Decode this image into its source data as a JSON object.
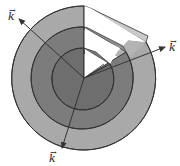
{
  "diagram": {
    "shells": [
      {
        "name": "outer",
        "radius": 72,
        "color": "#a9a9a9"
      },
      {
        "name": "middle",
        "radius": 51,
        "color": "#7c7c7c"
      },
      {
        "name": "inner",
        "radius": 31,
        "color": "#6e6e6e"
      }
    ],
    "cutaway_color": "#ffffff",
    "cut_face_color": "#c4c4c4",
    "outline_color": "#333333",
    "arrows": [
      {
        "name": "upper-left",
        "label": "k",
        "vector_mark": "→"
      },
      {
        "name": "right",
        "label": "k",
        "vector_mark": "→"
      },
      {
        "name": "bottom",
        "label": "k",
        "vector_mark": "→"
      }
    ]
  }
}
